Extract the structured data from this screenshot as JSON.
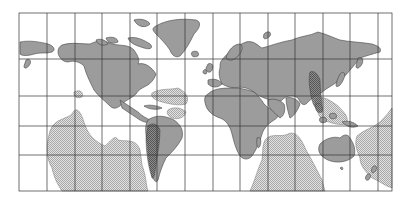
{
  "map": {
    "type": "world-map",
    "projection": "mercator",
    "frame": {
      "x": 19,
      "y": 13,
      "width": 373,
      "height": 178
    },
    "grid": {
      "vertical_lines_x": [
        47,
        75,
        102,
        130,
        157,
        185,
        213,
        240,
        268,
        295,
        323,
        350,
        378
      ],
      "horizontal_lines_y": [
        59,
        96,
        126,
        155
      ]
    },
    "colors": {
      "background": "#ffffff",
      "land": "#9c9c9c",
      "land_stroke": "#444444",
      "hatch_light": "#cfcfcf",
      "hatch_dark": "#6e6e6e",
      "grid": "#333333"
    },
    "legend_regions": [
      {
        "name": "modern-continents",
        "fill": "solid-gray"
      },
      {
        "name": "hypothetical-land-regions",
        "fill": "light-hatch"
      },
      {
        "name": "highlighted-regions",
        "fill": "dark-hatch"
      }
    ]
  }
}
